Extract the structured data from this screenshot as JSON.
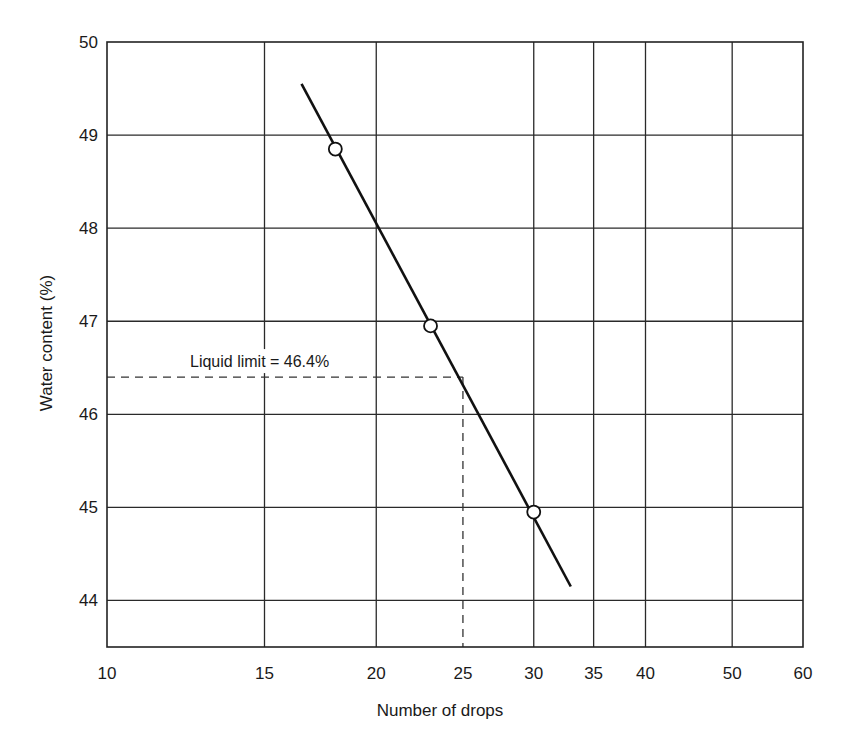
{
  "chart_data": {
    "type": "line",
    "title": "",
    "xlabel": "Number of drops",
    "ylabel": "Water content (%)",
    "x_scale": "log",
    "xlim": [
      10,
      60
    ],
    "ylim": [
      43.5,
      50
    ],
    "x_ticks": [
      10,
      15,
      20,
      25,
      30,
      35,
      40,
      50,
      60
    ],
    "x_tick_labels": [
      "10",
      "15",
      "20",
      "25",
      "30",
      "35",
      "40",
      "50",
      "60"
    ],
    "y_ticks": [
      44,
      45,
      46,
      47,
      48,
      49,
      50
    ],
    "y_tick_labels": [
      "44",
      "45",
      "46",
      "47",
      "48",
      "49",
      "50"
    ],
    "grid": true,
    "legend": null,
    "series": [
      {
        "name": "Test points",
        "type": "scatter",
        "marker": "open-circle",
        "x": [
          18,
          23,
          30
        ],
        "y": [
          48.85,
          46.95,
          44.95
        ]
      },
      {
        "name": "Flow curve",
        "type": "line",
        "x": [
          16.5,
          33
        ],
        "y": [
          49.55,
          44.15
        ]
      }
    ],
    "annotations": [
      {
        "text": "Liquid limit = 46.4%",
        "x_ref": 25,
        "y_ref": 46.4,
        "style": "dashed reference lines"
      }
    ]
  },
  "labels": {
    "x_axis": "Number of drops",
    "y_axis": "Water content (%)",
    "annotation": "Liquid limit = 46.4%"
  }
}
